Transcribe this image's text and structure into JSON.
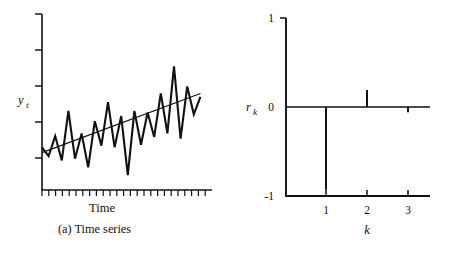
{
  "figure": {
    "panels": [
      {
        "id": "a",
        "caption": "(a) Time series",
        "y_axis_label": "y",
        "y_axis_label_sub": "t",
        "x_axis_label": "Time"
      },
      {
        "id": "b",
        "caption": "(b) Correlogram",
        "y_axis_label": "r",
        "y_axis_label_sub": "k",
        "x_axis_label": "k",
        "y_ticks": [
          "1",
          "0",
          "-1"
        ],
        "x_ticks": [
          "1",
          "2",
          "3"
        ]
      }
    ]
  },
  "chart_data": [
    {
      "type": "line",
      "id": "time-series",
      "title": "(a) Time series",
      "xlabel": "Time",
      "ylabel": "y_t",
      "grid": false,
      "legend": "none",
      "xlim": [
        0,
        25
      ],
      "ylim": [
        0,
        10
      ],
      "x_tick_count": 25,
      "y_tick_count": 5,
      "axis_tick_labels": {
        "x": [],
        "y": []
      },
      "series": [
        {
          "name": "y_t",
          "x": [
            0,
            1,
            2,
            3,
            4,
            5,
            6,
            7,
            8,
            9,
            10,
            11,
            12,
            13,
            14,
            15,
            16,
            17,
            18,
            19,
            20,
            21,
            22,
            23,
            24
          ],
          "values": [
            2.45,
            1.95,
            3.1,
            1.7,
            4.55,
            1.8,
            3.25,
            1.3,
            3.95,
            2.55,
            5.05,
            2.45,
            4.25,
            0.85,
            4.55,
            2.6,
            4.45,
            3.05,
            5.55,
            3.25,
            7.1,
            2.95,
            5.95,
            4.35,
            5.35
          ]
        }
      ],
      "trend_line": {
        "name": "linear trend",
        "x": [
          0,
          24
        ],
        "values": [
          2.15,
          5.55
        ]
      },
      "annotations": []
    },
    {
      "type": "bar",
      "id": "correlogram",
      "title": "(b) Correlogram",
      "xlabel": "k",
      "ylabel": "r_k",
      "grid": false,
      "legend": "none",
      "xlim": [
        0,
        3.6
      ],
      "ylim": [
        -1,
        1
      ],
      "y_tick_labels": [
        "1",
        "0",
        "-1"
      ],
      "y_tick_values": [
        1,
        0,
        -1
      ],
      "categories": [
        "1",
        "2",
        "3"
      ],
      "values": [
        -0.93,
        0.19,
        -0.06
      ],
      "zero_line": true,
      "annotations": []
    }
  ]
}
